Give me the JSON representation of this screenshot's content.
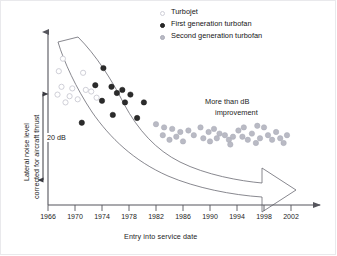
{
  "chart_data": {
    "type": "scatter",
    "title": "",
    "xlabel": "Entry into service date",
    "ylabel": "Lateral noise level corrected for aircraft thrust",
    "xlim": [
      1966,
      2004
    ],
    "ylim": [
      0,
      100
    ],
    "grid": false,
    "legend_position": "top-right",
    "annotations": [
      {
        "id": "scale-bar",
        "text": "20 dB"
      },
      {
        "id": "arrow-note-line1",
        "text": "More than dB"
      },
      {
        "id": "arrow-note-line2",
        "text": "improvement"
      }
    ],
    "xticks": [
      1966,
      1970,
      1974,
      1978,
      1982,
      1986,
      1990,
      1994,
      1998,
      2002
    ],
    "yticks": [],
    "series": [
      {
        "name": "Turbojet",
        "marker": "open-circle",
        "color": "#d8d8de",
        "edge": "#c9c9d2",
        "points": [
          [
            1968.2,
            88
          ],
          [
            1967.6,
            80
          ],
          [
            1971.2,
            79
          ],
          [
            1968.0,
            70
          ],
          [
            1969.6,
            69
          ],
          [
            1971.6,
            68
          ],
          [
            1967.4,
            65
          ],
          [
            1969.2,
            64
          ],
          [
            1972.4,
            67
          ],
          [
            1970.4,
            62
          ],
          [
            1968.6,
            60
          ],
          [
            1973.2,
            63
          ]
        ]
      },
      {
        "name": "First generation turbofan",
        "marker": "filled-circle",
        "color": "#2b2b2b",
        "edge": "#1a1a1a",
        "points": [
          [
            1974.2,
            82
          ],
          [
            1973.0,
            71
          ],
          [
            1975.4,
            70
          ],
          [
            1977.0,
            68
          ],
          [
            1976.2,
            66
          ],
          [
            1978.2,
            65
          ],
          [
            1974.0,
            61
          ],
          [
            1977.4,
            60
          ],
          [
            1980.2,
            60
          ],
          [
            1975.6,
            52
          ],
          [
            1979.2,
            50
          ],
          [
            1971.0,
            47
          ]
        ]
      },
      {
        "name": "Second generation turbofan",
        "marker": "filled-circle-gray",
        "color": "#b9bac4",
        "edge": "#a9aab6",
        "points": [
          [
            1982.0,
            46
          ],
          [
            1983.2,
            44
          ],
          [
            1984.4,
            43
          ],
          [
            1983.0,
            39
          ],
          [
            1985.6,
            41
          ],
          [
            1986.8,
            42
          ],
          [
            1985.0,
            38
          ],
          [
            1987.6,
            39
          ],
          [
            1984.0,
            36
          ],
          [
            1988.6,
            44
          ],
          [
            1989.8,
            41
          ],
          [
            1990.6,
            43
          ],
          [
            1991.4,
            40
          ],
          [
            1991.0,
            37
          ],
          [
            1992.2,
            39
          ],
          [
            1992.8,
            36
          ],
          [
            1993.4,
            38
          ],
          [
            1990.0,
            35
          ],
          [
            1994.2,
            42
          ],
          [
            1994.8,
            38
          ],
          [
            1995.6,
            36
          ],
          [
            1996.2,
            40
          ],
          [
            1996.8,
            34
          ],
          [
            1997.4,
            37
          ],
          [
            1998.0,
            44
          ],
          [
            1998.6,
            39
          ],
          [
            1999.2,
            36
          ],
          [
            1999.8,
            41
          ],
          [
            2000.4,
            37
          ],
          [
            2000.9,
            34
          ],
          [
            2001.4,
            39
          ],
          [
            1997.0,
            45
          ],
          [
            1995.0,
            44
          ],
          [
            1989.0,
            37
          ],
          [
            1986.0,
            35
          ],
          [
            1993.0,
            33
          ]
        ]
      }
    ]
  },
  "legend": {
    "items": [
      {
        "label": "Turbojet",
        "marker": "open-circle"
      },
      {
        "label": "First generation turbofan",
        "marker": "filled-circle"
      },
      {
        "label": "Second generation turbofan",
        "marker": "gray-circle"
      }
    ]
  },
  "axis": {
    "x_title": "Entry into service date",
    "y_title_line1": "Lateral noise level",
    "y_title_line2": "corrected for aircraft thrust",
    "x_tick_labels": [
      "1966",
      "1970",
      "1974",
      "1978",
      "1982",
      "1986",
      "1990",
      "1994",
      "1998",
      "2002"
    ]
  },
  "annotations": {
    "scale_label": "20 dB",
    "improvement_line1": "More than dB",
    "improvement_line2": "improvement"
  },
  "colors": {
    "turbojet": "#d8d8de",
    "first_gen": "#2b2b2b",
    "second_gen": "#b9bac4",
    "axis": "#55555c",
    "arrow_outline": "#6a6a72",
    "text": "#1c1c1c"
  }
}
